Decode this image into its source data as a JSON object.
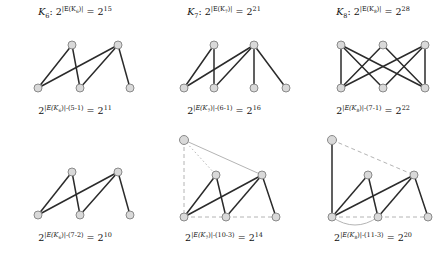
{
  "figure": {
    "rows": [
      {
        "id": "row-top",
        "panels": [
          {
            "id": "panel-k6-top",
            "top_label": {
              "graph_name": "K",
              "graph_index": "6",
              "prefix": ": 2",
              "exponent_inner": "|E(K",
              "exponent_sub": "6",
              "exponent_close": ")|",
              "equals": "=",
              "result_base": "2",
              "result_exponent": "15",
              "plain": "K6: 2^|E(K6)| = 2^15"
            },
            "bottom_label": {
              "base": "2",
              "exponent": "|E(K6)|-(5-1)",
              "exp_name": "E(K",
              "exp_sub": "6",
              "exp_tail": ")|-(5-1)",
              "equals": "=",
              "result_base": "2",
              "result_exponent": "11",
              "plain": "2^(|E(K6)|-(5-1)) = 2^11"
            },
            "graph": {
              "nodes": 5,
              "new_node": false,
              "description": "zigzag-path-5-vertices"
            }
          },
          {
            "id": "panel-k7-top",
            "top_label": {
              "graph_name": "K",
              "graph_index": "7",
              "prefix": ": 2",
              "exponent_inner": "|E(K",
              "exponent_sub": "7",
              "exponent_close": ")|",
              "equals": "=",
              "result_base": "2",
              "result_exponent": "21",
              "plain": "K7: 2^|E(K7)| = 2^21"
            },
            "bottom_label": {
              "base": "2",
              "exponent": "|E(K7)|-(6-1)",
              "exp_name": "E(K",
              "exp_sub": "7",
              "exp_tail": ")|-(6-1)",
              "equals": "=",
              "result_base": "2",
              "result_exponent": "16",
              "plain": "2^(|E(K7)|-(6-1)) = 2^16"
            },
            "graph": {
              "nodes": 6,
              "new_node": false,
              "description": "two-apex-four-base-tree"
            }
          },
          {
            "id": "panel-k8-top",
            "top_label": {
              "graph_name": "K",
              "graph_index": "8",
              "prefix": ": 2",
              "exponent_inner": "|E(K",
              "exponent_sub": "8",
              "exponent_close": ")|",
              "equals": "=",
              "result_base": "2",
              "result_exponent": "28",
              "plain": "K8: 2^|E(K8)| = 2^28"
            },
            "bottom_label": {
              "base": "2",
              "exponent": "|E(K8)|-(7-1)",
              "exp_name": "E(K",
              "exp_sub": "8",
              "exp_tail": ")|-(7-1)",
              "equals": "=",
              "result_base": "2",
              "result_exponent": "22",
              "plain": "2^(|E(K8)|-(7-1)) = 2^22"
            },
            "graph": {
              "nodes": 6,
              "new_node": false,
              "description": "bipartite-3-by-3-crossing"
            }
          }
        ]
      },
      {
        "id": "row-bottom",
        "panels": [
          {
            "id": "panel-k6-bottom",
            "bottom_label": {
              "base": "2",
              "exponent": "|E(K6)|-(7-2)",
              "exp_name": "E(K",
              "exp_sub": "6",
              "exp_tail": ")|-(7-2)",
              "equals": "=",
              "result_base": "2",
              "result_exponent": "10",
              "plain": "2^(|E(K6)|-(7-2)) = 2^10"
            },
            "graph": {
              "nodes": 5,
              "new_node": false,
              "description": "zigzag-path-5-vertices"
            }
          },
          {
            "id": "panel-k7-bottom",
            "bottom_label": {
              "base": "2",
              "exponent": "|E(K7)|-(10-3)",
              "exp_name": "E(K",
              "exp_sub": "7",
              "exp_tail": ")|-(10-3)",
              "equals": "=",
              "result_base": "2",
              "result_exponent": "14",
              "plain": "2^(|E(K7)|-(10-3)) = 2^14"
            },
            "graph": {
              "nodes": 6,
              "new_node": true,
              "description": "zigzag-with-ghost-apex-upper-left"
            }
          },
          {
            "id": "panel-k8-bottom",
            "bottom_label": {
              "base": "2",
              "exponent": "|E(K8)|-(11-3)",
              "exp_name": "E(K",
              "exp_sub": "8",
              "exp_tail": ")|-(11-3)",
              "equals": "=",
              "result_base": "2",
              "result_exponent": "20",
              "plain": "2^(|E(K8)|-(11-3)) = 2^20"
            },
            "graph": {
              "nodes": 6,
              "new_node": true,
              "description": "zigzag-with-ghost-apex-and-dashed-cycle"
            }
          }
        ]
      }
    ],
    "colors": {
      "node_fill": "#d9d9d9",
      "node_stroke": "#8a8a8a",
      "edge": "#2b2b2b",
      "ghost_edge": "#b4b4b4",
      "text": "#111111",
      "background": "#ffffff"
    }
  }
}
